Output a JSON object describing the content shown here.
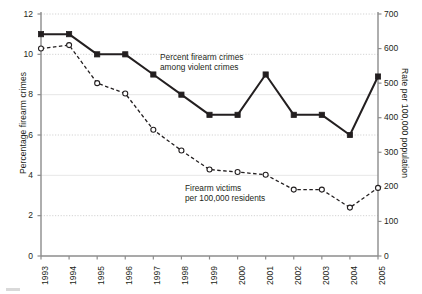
{
  "chart_data": {
    "type": "line",
    "title": "",
    "xlabel": "",
    "categories": [
      "1993",
      "1994",
      "1995",
      "1996",
      "1997",
      "1998",
      "1999",
      "2000",
      "2001",
      "2002",
      "2003",
      "2004",
      "2005"
    ],
    "grid": true,
    "legend_position": "inline-annotations",
    "axes": {
      "left": {
        "label": "Percentage firearm crimes",
        "ticks": [
          "0",
          "2",
          "4",
          "6",
          "8",
          "10",
          "12"
        ],
        "tick_values": [
          0,
          2,
          4,
          6,
          8,
          10,
          12
        ],
        "ylim": [
          0,
          12
        ]
      },
      "right": {
        "label": "Rate per 100,000 population",
        "ticks": [
          "0",
          "100",
          "200",
          "300",
          "400",
          "500",
          "600",
          "700"
        ],
        "tick_values": [
          0,
          100,
          200,
          300,
          400,
          500,
          600,
          700
        ],
        "ylim": [
          0,
          700
        ]
      }
    },
    "series": [
      {
        "name": "Percent firearm crimes among violent crimes",
        "axis": "left",
        "style": "solid",
        "marker": "filled-square",
        "color": "#231f20",
        "values": [
          11,
          11,
          10,
          10,
          9,
          8,
          7,
          7,
          9,
          7,
          7,
          6,
          8.9
        ]
      },
      {
        "name": "Firearm victims per 100,000 residents",
        "axis": "right",
        "style": "dashed",
        "marker": "open-circle",
        "color": "#231f20",
        "values": [
          600,
          610,
          500,
          470,
          365,
          305,
          250,
          243,
          235,
          192,
          192,
          140,
          197
        ]
      }
    ],
    "annotations": [
      {
        "id": "solid",
        "line1": "Percent firearm crimes",
        "line2": "among violent crimes"
      },
      {
        "id": "dashed",
        "line1": "Firearm victims",
        "line2": "per 100,000 residents"
      }
    ]
  },
  "colors": {
    "ink": "#231f20",
    "axis": "#8c8c8c",
    "grid": "#c8c8c8"
  }
}
